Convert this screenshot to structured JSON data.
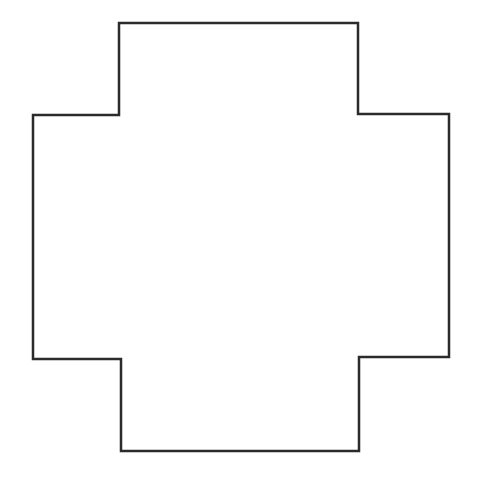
{
  "diagram": {
    "type": "polygon-outline",
    "shape": "cross",
    "stroke_color": "#2b2b2b",
    "fill_color": "#ffffff",
    "stroke_width": 2.5,
    "points": [
      [
        119,
        23
      ],
      [
        358,
        23
      ],
      [
        358,
        114
      ],
      [
        449,
        114
      ],
      [
        449,
        357
      ],
      [
        359,
        357
      ],
      [
        359,
        451
      ],
      [
        121,
        451
      ],
      [
        121,
        359
      ],
      [
        33,
        359
      ],
      [
        33,
        115
      ],
      [
        119,
        115
      ]
    ]
  }
}
